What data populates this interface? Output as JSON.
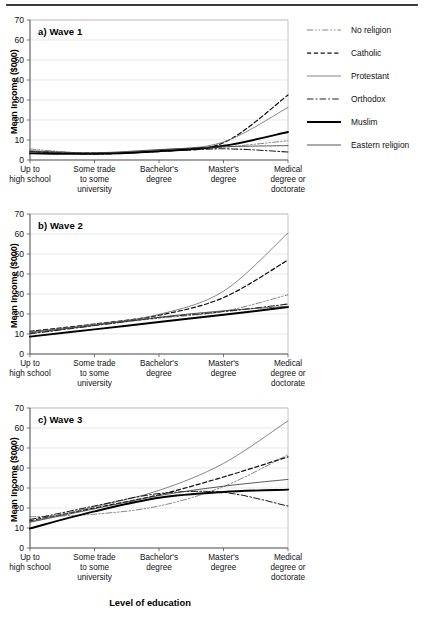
{
  "figure": {
    "xaxis_title": "Level of education",
    "yaxis_title": "Mean Income ($000)"
  },
  "legend": {
    "items": [
      {
        "label": "No religion",
        "style": "dash-dot-dot-thin"
      },
      {
        "label": "Catholic",
        "style": "dashed"
      },
      {
        "label": "Protestant",
        "style": "solid-thin"
      },
      {
        "label": "Orthodox",
        "style": "dash-dot"
      },
      {
        "label": "Muslim",
        "style": "solid-thick"
      },
      {
        "label": "Eastern religion",
        "style": "solid-thin"
      }
    ]
  },
  "chart_data": [
    {
      "type": "line",
      "title": "a)  Wave 1",
      "panel": "a",
      "xlabel": "Level of education",
      "ylabel": "Mean Income ($000)",
      "ylim": [
        0,
        70
      ],
      "yticks": [
        0,
        10,
        20,
        30,
        40,
        50,
        60,
        70
      ],
      "grid": true,
      "categories": [
        "Up to\nhigh school",
        "Some trade\nto some\nuniversity",
        "Bachelor's\ndegree",
        "Master's\ndegree",
        "Medical\ndegree or\ndoctorate"
      ],
      "series": [
        {
          "name": "No religion",
          "values": [
            5.5,
            3.2,
            4.2,
            6.4,
            9.6
          ]
        },
        {
          "name": "Catholic",
          "values": [
            4.2,
            3.4,
            4.5,
            8.6,
            32.5
          ]
        },
        {
          "name": "Protestant",
          "values": [
            4.0,
            3.4,
            5.0,
            9.0,
            26.3
          ]
        },
        {
          "name": "Orthodox",
          "values": [
            4.3,
            2.9,
            4.2,
            5.6,
            4.0
          ]
        },
        {
          "name": "Muslim",
          "values": [
            3.3,
            3.1,
            4.4,
            7.1,
            14.0
          ]
        },
        {
          "name": "Eastern religion",
          "values": [
            4.6,
            3.6,
            5.2,
            6.6,
            7.2
          ]
        }
      ]
    },
    {
      "type": "line",
      "title": "b)  Wave 2",
      "panel": "b",
      "xlabel": "Level of education",
      "ylabel": "Mean Income ($000)",
      "ylim": [
        0,
        70
      ],
      "yticks": [
        0,
        10,
        20,
        30,
        40,
        50,
        60,
        70
      ],
      "grid": true,
      "categories": [
        "Up to\nhigh school",
        "Some trade\nto some\nuniversity",
        "Bachelor's\ndegree",
        "Master's\ndegree",
        "Medical\ndegree or\ndoctorate"
      ],
      "series": [
        {
          "name": "No religion",
          "values": [
            10.3,
            14.3,
            17.9,
            21.3,
            29.6
          ]
        },
        {
          "name": "Catholic",
          "values": [
            11.3,
            15.0,
            19.4,
            28.2,
            47.0
          ]
        },
        {
          "name": "Protestant",
          "values": [
            11.0,
            14.8,
            19.8,
            31.4,
            60.5
          ]
        },
        {
          "name": "Orthodox",
          "values": [
            10.1,
            14.2,
            18.2,
            21.2,
            25.0
          ]
        },
        {
          "name": "Muslim",
          "values": [
            8.7,
            12.3,
            16.0,
            19.6,
            23.5
          ]
        },
        {
          "name": "Eastern religion",
          "values": [
            10.6,
            14.4,
            18.4,
            21.6,
            23.8
          ]
        }
      ]
    },
    {
      "type": "line",
      "title": "c)  Wave 3",
      "panel": "c",
      "xlabel": "Level of education",
      "ylabel": "Mean Income ($000)",
      "ylim": [
        0,
        70
      ],
      "yticks": [
        0,
        10,
        20,
        30,
        40,
        50,
        60,
        70
      ],
      "grid": true,
      "categories": [
        "Up to\nhigh school",
        "Some trade\nto some\nuniversity",
        "Bachelor's\ndegree",
        "Master's\ndegree",
        "Medical\ndegree or\ndoctorate"
      ],
      "series": [
        {
          "name": "No religion",
          "values": [
            15.6,
            16.9,
            21.0,
            30.7,
            46.6
          ]
        },
        {
          "name": "Catholic",
          "values": [
            13.6,
            20.0,
            26.6,
            35.5,
            45.6
          ]
        },
        {
          "name": "Protestant",
          "values": [
            13.2,
            20.6,
            28.8,
            42.3,
            63.6
          ]
        },
        {
          "name": "Orthodox",
          "values": [
            14.2,
            21.0,
            27.2,
            27.8,
            21.0
          ]
        },
        {
          "name": "Muslim",
          "values": [
            9.8,
            18.3,
            25.1,
            28.0,
            29.2
          ]
        },
        {
          "name": "Eastern religion",
          "values": [
            12.9,
            19.6,
            26.2,
            30.9,
            34.3
          ]
        }
      ]
    }
  ]
}
